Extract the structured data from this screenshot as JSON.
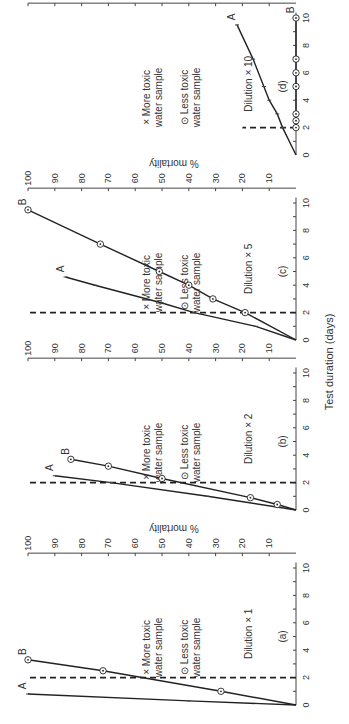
{
  "figure": {
    "rotation_deg": -90,
    "shared_xlabel": "Test duration (days)",
    "ylabel": "% mortality"
  },
  "legend": {
    "more_toxic_marker": "×",
    "more_toxic_line1": "More toxic",
    "more_toxic_line2": "water sample",
    "less_toxic_marker": "⊙",
    "less_toxic_line1": "Less toxic",
    "less_toxic_line2": "water sample"
  },
  "chart_data": [
    {
      "type": "line",
      "panel": "(a)",
      "title": "Dilution × 1",
      "xlabel": "Test duration (days)",
      "ylabel": "% mortality",
      "xlim": [
        0,
        10
      ],
      "ylim": [
        0,
        100
      ],
      "xticks": [
        0,
        2,
        4,
        6,
        8,
        10
      ],
      "yticks": [
        10,
        20,
        30,
        40,
        50,
        60,
        70,
        80,
        90,
        100
      ],
      "reference_line_x": 2,
      "series": [
        {
          "name": "A",
          "label": "More toxic water sample",
          "marker": "x",
          "x": [
            0,
            0.3,
            0.8
          ],
          "y": [
            0,
            40,
            100
          ]
        },
        {
          "name": "B",
          "label": "Less toxic water sample",
          "marker": "circle-dot",
          "x": [
            0,
            1,
            2.5,
            3.3
          ],
          "y": [
            0,
            28,
            72,
            100
          ]
        }
      ]
    },
    {
      "type": "line",
      "panel": "(b)",
      "title": "Dilution × 2",
      "xlabel": "Test duration (days)",
      "ylabel": "% mortality",
      "xlim": [
        0,
        10
      ],
      "ylim": [
        0,
        100
      ],
      "xticks": [
        0,
        2,
        4,
        6,
        8,
        10
      ],
      "yticks": [
        10,
        20,
        30,
        40,
        50,
        60,
        70,
        80,
        90,
        100
      ],
      "reference_line_x": 2,
      "series": [
        {
          "name": "A",
          "label": "More toxic water sample",
          "marker": "x",
          "x": [
            0,
            1,
            2,
            2.5
          ],
          "y": [
            0,
            33,
            69,
            90
          ]
        },
        {
          "name": "B",
          "label": "Less toxic water sample",
          "marker": "circle-dot",
          "x": [
            0,
            0.4,
            0.9,
            2.3,
            3.2,
            3.7
          ],
          "y": [
            0,
            7,
            17,
            50,
            70,
            84
          ]
        }
      ]
    },
    {
      "type": "line",
      "panel": "(c)",
      "title": "Dilution × 5",
      "xlabel": "Test duration (days)",
      "ylabel": "% mortality",
      "xlim": [
        0,
        10
      ],
      "ylim": [
        0,
        100
      ],
      "xticks": [
        0,
        2,
        4,
        6,
        8,
        10
      ],
      "yticks": [
        10,
        20,
        30,
        40,
        50,
        60,
        70,
        80,
        90,
        100
      ],
      "reference_line_x": 2,
      "series": [
        {
          "name": "A",
          "label": "More toxic water sample",
          "marker": "x",
          "x": [
            0,
            1,
            2,
            2.7,
            4,
            4.6
          ],
          "y": [
            0,
            15,
            38,
            50,
            75,
            86
          ]
        },
        {
          "name": "B",
          "label": "Less toxic water sample",
          "marker": "circle-dot",
          "x": [
            0,
            2,
            3,
            4,
            5,
            7,
            9.5
          ],
          "y": [
            0,
            19,
            31,
            40,
            51,
            73,
            100
          ]
        }
      ]
    },
    {
      "type": "line",
      "panel": "(d)",
      "title": "Dilution × 10",
      "xlabel": "Test duration (days)",
      "ylabel": "% mortality",
      "xlim": [
        0,
        10
      ],
      "ylim": [
        0,
        100
      ],
      "xticks": [
        0,
        2,
        4,
        6,
        8,
        10
      ],
      "yticks": [
        10,
        20,
        30,
        40,
        50,
        60,
        70,
        80,
        90,
        100
      ],
      "reference_line_x": 2,
      "reference_line_ymax": 20,
      "series": [
        {
          "name": "A",
          "label": "More toxic water sample",
          "marker": "x",
          "x": [
            0,
            2,
            3,
            4,
            5,
            7,
            9.5
          ],
          "y": [
            0,
            5,
            7,
            10,
            12,
            16,
            22
          ]
        },
        {
          "name": "B",
          "label": "Less toxic water sample",
          "marker": "circle-dot",
          "x": [
            2,
            2.5,
            3,
            5,
            6,
            7,
            10
          ],
          "y": [
            0,
            0,
            0,
            0,
            0,
            0,
            0
          ]
        }
      ]
    }
  ]
}
